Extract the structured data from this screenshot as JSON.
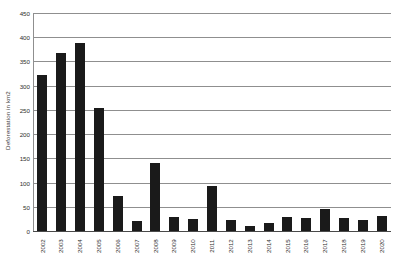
{
  "chart_data": {
    "type": "bar",
    "title": "",
    "xlabel": "",
    "ylabel": "Deforestation in km2",
    "ylim": [
      0,
      450
    ],
    "ytick_step": 50,
    "yticks": [
      0,
      50,
      100,
      150,
      200,
      250,
      300,
      350,
      400,
      450
    ],
    "ytick_labels": [
      "0",
      "50",
      "100",
      "150",
      "200",
      "250",
      "300",
      "350",
      "400",
      "450"
    ],
    "grid": true,
    "legend": null,
    "bar_color": "#1a1a1a",
    "gridline_color": "#8f8f8f",
    "categories": [
      "2002",
      "2003",
      "2004",
      "2005",
      "2006",
      "2007",
      "2008",
      "2009",
      "2010",
      "2011",
      "2012",
      "2013",
      "2014",
      "2015",
      "2016",
      "2017",
      "2018",
      "2019",
      "2020"
    ],
    "values": [
      325,
      370,
      390,
      255,
      75,
      22,
      143,
      32,
      27,
      95,
      24,
      12,
      18,
      32,
      28,
      47,
      28,
      25,
      33
    ]
  }
}
